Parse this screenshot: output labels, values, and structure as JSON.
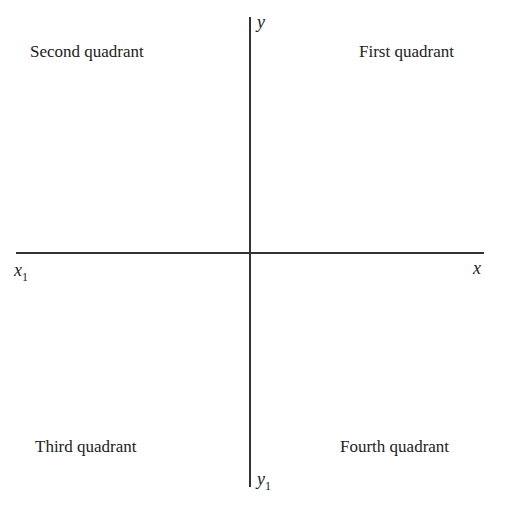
{
  "diagram": {
    "type": "cartesian-quadrants",
    "axes": {
      "x_positive": "x",
      "x_negative": {
        "base": "x",
        "sub": "1"
      },
      "y_positive": "y",
      "y_negative": {
        "base": "y",
        "sub": "1"
      }
    },
    "quadrants": {
      "first": "First quadrant",
      "second": "Second quadrant",
      "third": "Third quadrant",
      "fourth": "Fourth quadrant"
    }
  }
}
